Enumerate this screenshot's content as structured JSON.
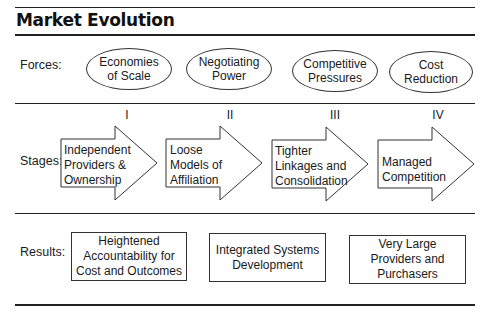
{
  "title": "Market Evolution",
  "forces": {
    "label": "Forces:",
    "items": [
      {
        "text": "Economies\nof Scale"
      },
      {
        "text": "Negotiating\nPower"
      },
      {
        "text": "Competitive\nPressures"
      },
      {
        "text": "Cost\nReduction"
      }
    ]
  },
  "stages": {
    "label": "Stages:",
    "items": [
      {
        "numeral": "I",
        "text": "Independent\nProviders &\nOwnership"
      },
      {
        "numeral": "II",
        "text": "Loose\nModels of\nAffiliation"
      },
      {
        "numeral": "III",
        "text": "Tighter\nLinkages and\nConsolidation"
      },
      {
        "numeral": "IV",
        "text": "Managed\nCompetition"
      }
    ]
  },
  "results": {
    "label": "Results:",
    "items": [
      {
        "text": "Heightened\nAccountability for\nCost and Outcomes"
      },
      {
        "text": "Integrated Systems\nDevelopment"
      },
      {
        "text": "Very Large\nProviders and\nPurchasers"
      }
    ]
  }
}
